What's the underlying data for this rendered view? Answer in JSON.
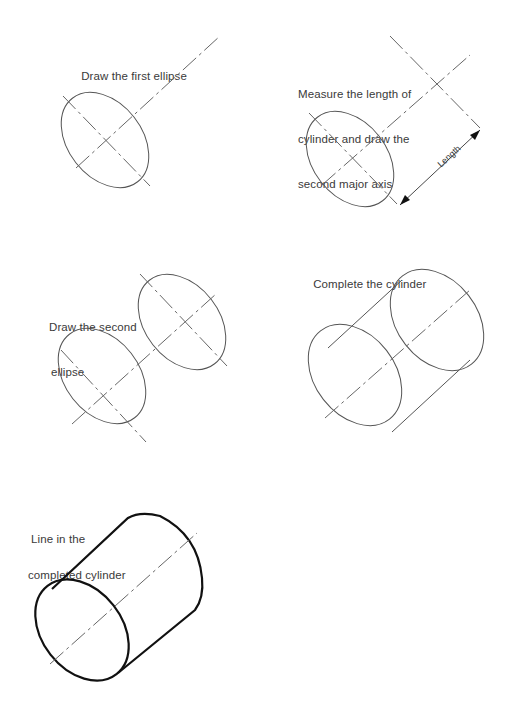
{
  "steps": [
    {
      "id": 1,
      "caption": [
        "Draw the first ellipse"
      ]
    },
    {
      "id": 2,
      "caption": [
        "Measure the length of",
        "cylinder and draw the",
        "second major axis"
      ],
      "dimension_label": "Length"
    },
    {
      "id": 3,
      "caption": [
        "Draw the second",
        "ellipse"
      ]
    },
    {
      "id": 4,
      "caption": [
        "Complete the cylinder"
      ]
    },
    {
      "id": 5,
      "caption": [
        "Line in the",
        "completed cylinder"
      ]
    }
  ],
  "colors": {
    "background": "#ffffff",
    "line": "#555555",
    "bold_line": "#111111",
    "text": "#3a3a3a"
  }
}
